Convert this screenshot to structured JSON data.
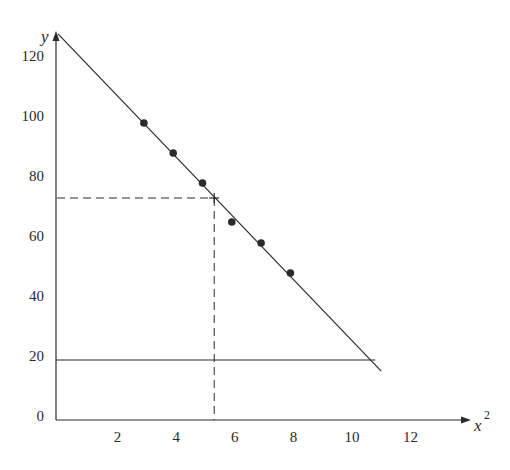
{
  "chart_data": {
    "type": "scatter",
    "title": "",
    "xlabel": "x",
    "xlabel_superscript": "2",
    "ylabel": "y",
    "xlim": [
      0,
      14
    ],
    "ylim": [
      0,
      130
    ],
    "grid": false,
    "legend": null,
    "x_ticks": [
      2,
      4,
      6,
      8,
      10,
      12
    ],
    "y_ticks": [
      0,
      20,
      40,
      60,
      80,
      100,
      120
    ],
    "points": [
      {
        "x": 3,
        "y": 99
      },
      {
        "x": 4,
        "y": 89
      },
      {
        "x": 5,
        "y": 79
      },
      {
        "x": 6,
        "y": 66
      },
      {
        "x": 7,
        "y": 59
      },
      {
        "x": 8,
        "y": 49
      }
    ],
    "fit_line": {
      "x0": 0,
      "y0": 128.7,
      "x1": 11.1,
      "y1": 16.3
    },
    "reference_line": {
      "y": 20,
      "x0": 0,
      "x1": 10.9
    },
    "marker": {
      "x": 5.4,
      "y": 74,
      "dashed_guides": true
    }
  },
  "colors": {
    "ink": "#2a2a2a",
    "background": "#ffffff"
  }
}
